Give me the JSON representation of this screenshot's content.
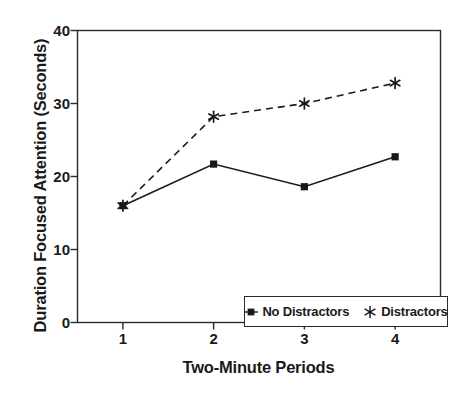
{
  "chart_data": {
    "type": "line",
    "title": "",
    "xlabel": "Two-Minute Periods",
    "ylabel": "Duration Focused Attention (Seconds)",
    "categories": [
      "1",
      "2",
      "3",
      "4"
    ],
    "x": [
      1,
      2,
      3,
      4
    ],
    "xlim": [
      0.5,
      4.5
    ],
    "ylim": [
      0,
      40
    ],
    "yticks": [
      0,
      10,
      20,
      30,
      40
    ],
    "ytick_labels": [
      "0",
      "10",
      "20",
      "30",
      "40"
    ],
    "xticks": [
      1,
      2,
      3,
      4
    ],
    "xtick_labels": [
      "1",
      "2",
      "3",
      "4"
    ],
    "grid": false,
    "legend_position": "lower right",
    "series": [
      {
        "name": "No Distractors",
        "values": [
          16.0,
          21.7,
          18.6,
          22.7
        ],
        "marker": "square-filled-marker",
        "linestyle": "solid",
        "color": "#1a1a1a"
      },
      {
        "name": "Distractors",
        "values": [
          16.0,
          28.2,
          30.0,
          32.8
        ],
        "marker": "asterisk-marker",
        "linestyle": "dashed",
        "color": "#1a1a1a"
      }
    ]
  },
  "axes": {
    "spine_color": "#2b2b2b",
    "background": "#ffffff"
  }
}
